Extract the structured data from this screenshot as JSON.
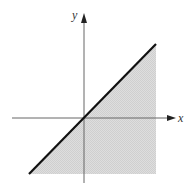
{
  "figure": {
    "axes": {
      "x_label": "x",
      "y_label": "y"
    },
    "line": {
      "equation": "y = x",
      "color": "#111111",
      "style": "solid thick"
    },
    "shaded_region": {
      "description": "region below/right of line y = x",
      "color": "#d9d9d9"
    },
    "colors": {
      "axis": "#555555",
      "background": "#ffffff"
    }
  }
}
